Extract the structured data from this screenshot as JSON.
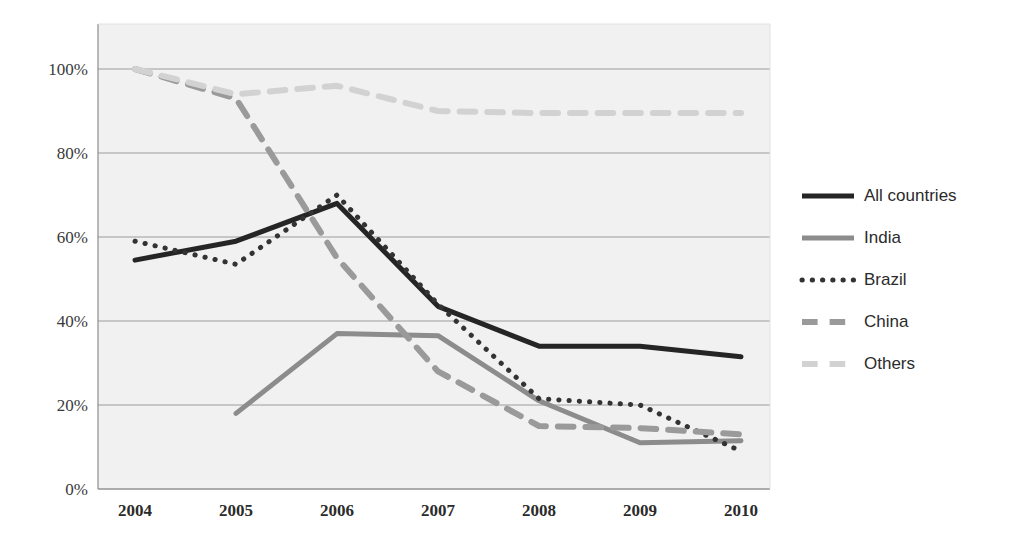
{
  "chart_data": {
    "type": "line",
    "title": "",
    "subtitle": "",
    "xlabel": "",
    "ylabel": "",
    "categories": [
      "2004",
      "2005",
      "2006",
      "2007",
      "2008",
      "2009",
      "2010"
    ],
    "x": [
      2004,
      2005,
      2006,
      2007,
      2008,
      2009,
      2010
    ],
    "ylim": [
      0,
      100
    ],
    "xlim": [
      2004,
      2010
    ],
    "yticks": [
      0,
      20,
      40,
      60,
      80,
      100
    ],
    "ytick_labels": [
      "0%",
      "20%",
      "40%",
      "60%",
      "80%",
      "100%"
    ],
    "xtick_labels": [
      "2004",
      "2005",
      "2006",
      "2007",
      "2008",
      "2009",
      "2010"
    ],
    "grid": true,
    "grid_axis": "y",
    "legend_position": "right",
    "value_suffix": "%",
    "series": [
      {
        "name": "All countries",
        "style": "solid",
        "color": "#252525",
        "width": 5,
        "values": [
          54.5,
          59,
          68,
          43.5,
          34,
          34,
          31.5
        ]
      },
      {
        "name": "India",
        "style": "solid",
        "color": "#8c8c8c",
        "width": 5,
        "values": [
          null,
          18,
          37,
          36.5,
          21,
          11,
          11.5
        ]
      },
      {
        "name": "Brazil",
        "style": "dotted",
        "color": "#333333",
        "width": 5,
        "values": [
          59,
          53.5,
          70,
          44,
          21.5,
          20,
          9
        ]
      },
      {
        "name": "China",
        "style": "dashed",
        "color": "#9a9a9a",
        "width": 6,
        "values": [
          100,
          93,
          55,
          28,
          15,
          14.5,
          13
        ]
      },
      {
        "name": "Others",
        "style": "dashed",
        "color": "#d2d2d2",
        "width": 6,
        "values": [
          100,
          94,
          96,
          90,
          89.5,
          89.5,
          89.5
        ]
      }
    ]
  },
  "legend": {
    "items": [
      {
        "label": "All countries"
      },
      {
        "label": "India"
      },
      {
        "label": "Brazil"
      },
      {
        "label": "China"
      },
      {
        "label": "Others"
      }
    ]
  },
  "axes": {
    "y_labels": [
      "100%",
      "80%",
      "60%",
      "40%",
      "20%",
      "0%"
    ],
    "x_labels": [
      "2004",
      "2005",
      "2006",
      "2007",
      "2008",
      "2009",
      "2010"
    ]
  },
  "colors": {
    "plot_background": "#f1f1f1",
    "gridline": "#9c9c9c",
    "all_countries": "#252525",
    "india": "#8c8c8c",
    "brazil": "#333333",
    "china": "#9a9a9a",
    "others": "#d2d2d2"
  }
}
